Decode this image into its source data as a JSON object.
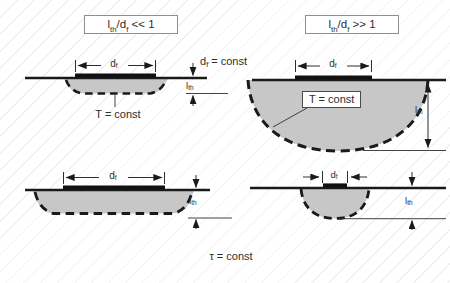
{
  "conditions": {
    "left": {
      "numerator_base": "l",
      "numerator_sub": "th",
      "denominator_base": "/d",
      "denominator_sub": "f",
      "relation": " << 1"
    },
    "right": {
      "numerator_base": "l",
      "numerator_sub": "th",
      "denominator_base": "/d",
      "denominator_sub": "f",
      "relation": " >> 1"
    }
  },
  "annotations": {
    "film_diameter_constant": {
      "base": "d",
      "sub": "f",
      "rest": " = const"
    },
    "isotherm_label": "T = const",
    "pulse_duration_constant": "τ = const"
  },
  "dimension_labels": {
    "film_diameter": {
      "base": "d",
      "sub": "f"
    },
    "thermal_penetration_depth": {
      "base": "l",
      "sub": "th"
    }
  },
  "colors": {
    "heated_region_fill": "#c3c3c3",
    "line_color": "#1a1a1a",
    "hatch_color": "#dcdcdc",
    "label_box_border": "#8f8f8f",
    "background": "#ffffff"
  }
}
